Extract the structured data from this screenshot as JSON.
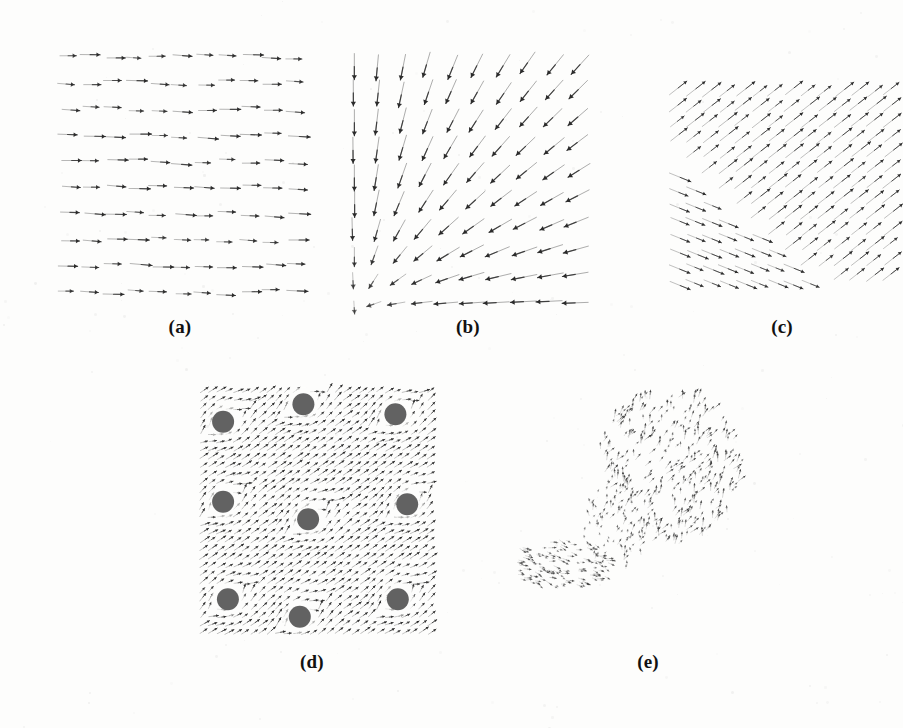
{
  "figure": {
    "background_color": "#fdfdfc",
    "ink_color": "#2b2b2b",
    "obstacle_color": "#555555",
    "width": 903,
    "height": 728
  },
  "panels": [
    {
      "id": "a",
      "label": "(a)",
      "caption_text": "(a)",
      "name": "uniform-translation-field",
      "field_type": "uniform",
      "x": 55,
      "y": 42,
      "w": 250,
      "h": 262,
      "label_x": 180,
      "label_y": 330,
      "grid_cols": 11,
      "grid_rows": 10,
      "arrow_scale": 20,
      "jitter": 2.6,
      "uniform_dx": 1.0,
      "uniform_dy": 0.04,
      "stroke_width": 1.0,
      "head_size": 3.6,
      "opacity_min": 0.28,
      "opacity_max": 0.95
    },
    {
      "id": "b",
      "label": "(b)",
      "caption_text": "(b)",
      "name": "radial-sink-field",
      "field_type": "sink",
      "x": 340,
      "y": 40,
      "w": 262,
      "h": 275,
      "label_x": 468,
      "label_y": 330,
      "grid_cols": 10,
      "grid_rows": 10,
      "arrow_scale": 26,
      "jitter": 1.6,
      "singularity_x": 0.055,
      "singularity_y": 0.985,
      "stroke_width": 1.05,
      "head_size": 4.2,
      "opacity_min": 0.3,
      "opacity_max": 1.0
    },
    {
      "id": "c",
      "label": "(c)",
      "caption_text": "(c)",
      "name": "motion-discontinuity-field",
      "field_type": "discontinuity",
      "x": 662,
      "y": 88,
      "w": 230,
      "h": 200,
      "label_x": 782,
      "label_y": 330,
      "grid_cols": 14,
      "grid_rows": 13,
      "arrow_scale": 22,
      "jitter": 1.2,
      "region_a_angle_deg": -38,
      "region_b_angle_deg": 22,
      "boundary_slope": 1.0,
      "boundary_offset": 0.02,
      "stroke_width": 0.85,
      "head_size": 3.0,
      "opacity_min": 0.3,
      "opacity_max": 0.95
    },
    {
      "id": "d",
      "label": "(d)",
      "caption_text": "(d)",
      "name": "flow-around-obstacles-field",
      "field_type": "obstacles",
      "x": 196,
      "y": 388,
      "w": 236,
      "h": 250,
      "label_x": 312,
      "label_y": 665,
      "grid_cols": 28,
      "grid_rows": 30,
      "arrow_scale": 11,
      "jitter": 0.7,
      "base_angle_deg": -34,
      "stroke_width": 0.8,
      "head_size": 2.3,
      "opacity_min": 0.35,
      "opacity_max": 1.0,
      "obstacle_radius": 11,
      "obstacle_halo": 17,
      "obstacles": [
        {
          "cx": 0.115,
          "cy": 0.135
        },
        {
          "cx": 0.455,
          "cy": 0.065
        },
        {
          "cx": 0.845,
          "cy": 0.105
        },
        {
          "cx": 0.115,
          "cy": 0.455
        },
        {
          "cx": 0.475,
          "cy": 0.525
        },
        {
          "cx": 0.895,
          "cy": 0.465
        },
        {
          "cx": 0.135,
          "cy": 0.845
        },
        {
          "cx": 0.44,
          "cy": 0.915
        },
        {
          "cx": 0.855,
          "cy": 0.845
        }
      ]
    },
    {
      "id": "e",
      "label": "(e)",
      "caption_text": "(e)",
      "name": "sparse-measured-flow-field",
      "field_type": "sparse",
      "x": 520,
      "y": 398,
      "w": 240,
      "h": 230,
      "label_x": 648,
      "label_y": 665,
      "arrow_scale": 9,
      "jitter": 1.8,
      "stroke_width": 0.6,
      "head_size": 1.9,
      "opacity_min": 0.18,
      "opacity_max": 0.8,
      "clusters": [
        {
          "name": "upper-fan-cluster",
          "cx": 0.62,
          "cy": 0.3,
          "rx": 0.3,
          "ry": 0.34,
          "count": 340,
          "angle_deg": -62,
          "angle_spread_deg": 34,
          "len_min": 0.35,
          "len_max": 1.0
        },
        {
          "name": "lower-left-streak-cluster",
          "cx": 0.17,
          "cy": 0.72,
          "rx": 0.22,
          "ry": 0.11,
          "count": 140,
          "angle_deg": 16,
          "angle_spread_deg": 22,
          "len_min": 0.3,
          "len_max": 0.85
        },
        {
          "name": "center-tail-cluster",
          "cx": 0.4,
          "cy": 0.55,
          "rx": 0.14,
          "ry": 0.2,
          "count": 90,
          "angle_deg": -78,
          "angle_spread_deg": 40,
          "len_min": 0.25,
          "len_max": 0.7
        }
      ]
    }
  ],
  "scan_artifacts": {
    "name": "scanner-speckle",
    "count": 210,
    "opacity": 0.06,
    "max_radius": 1.6
  }
}
